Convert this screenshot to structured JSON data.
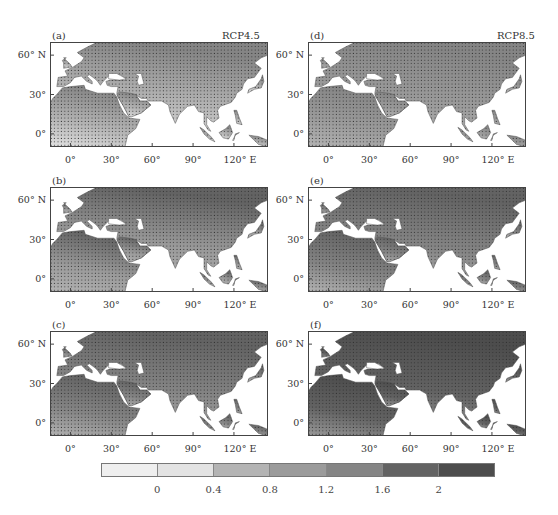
{
  "figure": {
    "scenarios": {
      "left": "RCP4.5",
      "right": "RCP8.5"
    },
    "panels": [
      {
        "id": "a",
        "label": "(a)",
        "scenario": "RCP4.5",
        "column": "left",
        "row": 1,
        "intensity": 0.45
      },
      {
        "id": "b",
        "label": "(b)",
        "scenario": "RCP4.5",
        "column": "left",
        "row": 2,
        "intensity": 0.6
      },
      {
        "id": "c",
        "label": "(c)",
        "scenario": "RCP4.5",
        "column": "left",
        "row": 3,
        "intensity": 0.68
      },
      {
        "id": "d",
        "label": "(d)",
        "scenario": "RCP8.5",
        "column": "right",
        "row": 1,
        "intensity": 0.55
      },
      {
        "id": "e",
        "label": "(e)",
        "scenario": "RCP8.5",
        "column": "right",
        "row": 2,
        "intensity": 0.68
      },
      {
        "id": "f",
        "label": "(f)",
        "scenario": "RCP8.5",
        "column": "right",
        "row": 3,
        "intensity": 0.85
      }
    ],
    "y_ticks": [
      "60° N",
      "30°",
      "0°"
    ],
    "x_ticks": [
      "0°",
      "30°",
      "60°",
      "90°",
      "120° E"
    ],
    "colorbar": {
      "labels": [
        "0",
        "0.4",
        "0.8",
        "1.2",
        "1.6",
        "2"
      ],
      "colors": [
        "#efefef",
        "#e3e3e3",
        "#b4b4b4",
        "#9b9b9b",
        "#858585",
        "#636363",
        "#4d4d4d"
      ]
    },
    "colors": {
      "ocean": "#ffffff",
      "frame": "#444444",
      "stipple": "#2f2f2f"
    }
  },
  "chart_data": {
    "type": "heatmap",
    "title": "",
    "panels": [
      "(a)",
      "(b)",
      "(c)",
      "(d)",
      "(e)",
      "(f)"
    ],
    "scenarios": [
      "RCP4.5",
      "RCP8.5"
    ],
    "x_axis": {
      "ticks": [
        "0°",
        "30°",
        "60°",
        "90°",
        "120° E"
      ],
      "range": [
        -15,
        145
      ]
    },
    "y_axis": {
      "ticks": [
        "0°",
        "30°",
        "60° N"
      ],
      "range": [
        -10,
        70
      ]
    },
    "colorbar_levels": [
      0,
      0.4,
      0.8,
      1.2,
      1.6,
      2
    ],
    "stippling": "dots indicate significance",
    "legend": "bottom"
  }
}
